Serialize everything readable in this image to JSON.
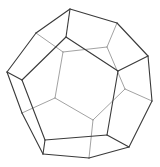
{
  "diagram": {
    "shape": "dodecahedron",
    "colors": {
      "background": "#ffffff",
      "front_edge": "#3a3a3a",
      "back_edge": "#8a8a8a"
    },
    "vertices": {
      "o0": [
        70,
        9
      ],
      "o1": [
        117,
        23
      ],
      "o2": [
        148,
        56
      ],
      "o3": [
        152,
        101
      ],
      "o4": [
        129,
        147
      ],
      "o5": [
        89,
        158
      ],
      "o6": [
        43,
        154
      ],
      "o7": [
        22,
        113
      ],
      "o8": [
        7,
        72
      ],
      "o9": [
        36,
        33
      ],
      "f0": [
        66,
        37
      ],
      "f1": [
        118,
        71
      ],
      "f2": [
        107,
        135
      ],
      "f3": [
        45,
        140
      ],
      "f4": [
        22,
        80
      ],
      "b0": [
        63,
        52
      ],
      "b1": [
        107,
        47
      ],
      "b2": [
        125,
        89
      ],
      "b3": [
        93,
        120
      ],
      "b4": [
        55,
        98
      ]
    },
    "front_edges": [
      [
        "o0",
        "o1"
      ],
      [
        "o1",
        "o2"
      ],
      [
        "o2",
        "o3"
      ],
      [
        "o3",
        "o4"
      ],
      [
        "o4",
        "o5"
      ],
      [
        "o5",
        "o6"
      ],
      [
        "o6",
        "o7"
      ],
      [
        "o7",
        "o8"
      ],
      [
        "o8",
        "o9"
      ],
      [
        "o9",
        "o0"
      ],
      [
        "f0",
        "f1"
      ],
      [
        "f1",
        "f2"
      ],
      [
        "f2",
        "f3"
      ],
      [
        "f3",
        "f4"
      ],
      [
        "f4",
        "f0"
      ],
      [
        "o0",
        "f0"
      ],
      [
        "o2",
        "f1"
      ],
      [
        "o4",
        "f2"
      ],
      [
        "o6",
        "f3"
      ],
      [
        "o8",
        "f4"
      ]
    ],
    "back_edges": [
      [
        "b0",
        "b1"
      ],
      [
        "b1",
        "b2"
      ],
      [
        "b2",
        "b3"
      ],
      [
        "b3",
        "b4"
      ],
      [
        "b4",
        "b0"
      ],
      [
        "o9",
        "b0"
      ],
      [
        "o1",
        "b1"
      ],
      [
        "o3",
        "b2"
      ],
      [
        "o5",
        "b3"
      ],
      [
        "o7",
        "b4"
      ]
    ]
  }
}
